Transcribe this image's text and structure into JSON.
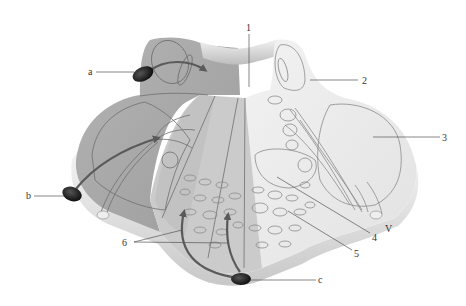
{
  "diagram": {
    "colors": {
      "background": "#ffffff",
      "left_lobe_dark": "#a8a8a8",
      "left_lobe_light": "#b8b8b8",
      "vermis_mid": "#cfcfcf",
      "right_lobe": "#e9e9e9",
      "edge_shadow": "#d4d4d4",
      "arrow": "#5a5a5a",
      "nucleus_dark": "#2a2a2a",
      "label_text": "#333333"
    },
    "labels": {
      "n1": "1",
      "n2": "2",
      "n3": "3",
      "n4": "4",
      "n5": "5",
      "n6": "6",
      "a": "a",
      "b": "b",
      "c": "c",
      "V": "V"
    }
  }
}
